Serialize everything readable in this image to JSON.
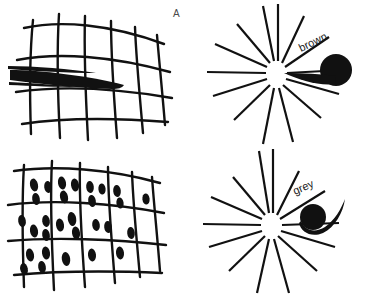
{
  "figure": {
    "title": "",
    "background_color": "#ffffff",
    "ink_color": "#111111",
    "letter_color": "#4a4a4a",
    "width": 378,
    "height": 294,
    "panel_count": 4
  },
  "panels": [
    {
      "id": "A",
      "letter": "A",
      "kind": "curved-grid-with-wedge-stroke",
      "description": "Hand-drawn curved grid with a tapering dark brush wedge across the middle",
      "grid": {
        "columns": 6,
        "rows": 4
      },
      "annotation_label": ""
    },
    {
      "id": "B",
      "letter": "B",
      "kind": "curved-grid-with-dots",
      "description": "Hand-drawn curved grid whose cells contain small dark ellipses",
      "grid": {
        "columns": 5,
        "rows": 3
      },
      "annotation_label": ""
    },
    {
      "id": "C",
      "letter": "C",
      "kind": "radial-starburst-with-tadpole",
      "description": "Radial starburst of straight rays with a tadpole shape, head outward, tail pointing to centre",
      "ray_count": 14,
      "annotation_label": "brown"
    },
    {
      "id": "D",
      "letter": "D",
      "kind": "radial-starburst-with-tadpole",
      "description": "Radial starburst of straight rays with a smaller tadpole shape, head inward, tail sweeping outward",
      "ray_count": 14,
      "annotation_label": "grey"
    }
  ]
}
